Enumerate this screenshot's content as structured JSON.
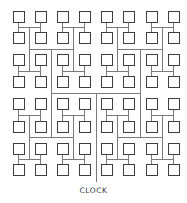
{
  "diagram": {
    "label": "CLOCK",
    "node_count": 64,
    "grid": {
      "columns": 8,
      "rows": 8
    },
    "geometry": {
      "box_size": 11,
      "column_left": [
        13,
        35,
        57,
        79,
        101,
        123,
        146,
        168
      ],
      "row_top": [
        11,
        32,
        54,
        76,
        98,
        121,
        143,
        164
      ],
      "trunk": {
        "x": 96,
        "y_top": 93,
        "y_bottom": 182
      }
    },
    "colors": {
      "wire": "#7a7a7a",
      "node_stroke": "#3f3f3f",
      "node_fill": "#ffffff",
      "label": "#333333",
      "background": "#ffffff"
    }
  }
}
